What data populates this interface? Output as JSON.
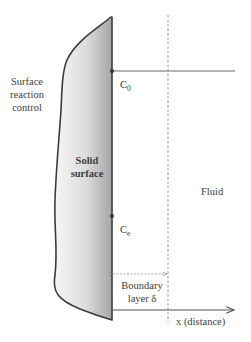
{
  "diagram": {
    "labels": {
      "surface_reaction_control": [
        "Surface",
        "reaction",
        "control"
      ],
      "solid_surface": [
        "Solid",
        "surface"
      ],
      "fluid": "Fluid",
      "c0": {
        "base": "C",
        "sub": "0"
      },
      "ce": {
        "base": "C",
        "sub": "e"
      },
      "boundary_layer": [
        "Boundary",
        "layer δ"
      ],
      "x_axis": "x (distance)"
    },
    "colors": {
      "solid_fill_light": "#f4f4f4",
      "solid_fill_dark": "#a9a9a9",
      "outline": "#3c3c3c",
      "lines": "#555555"
    }
  }
}
